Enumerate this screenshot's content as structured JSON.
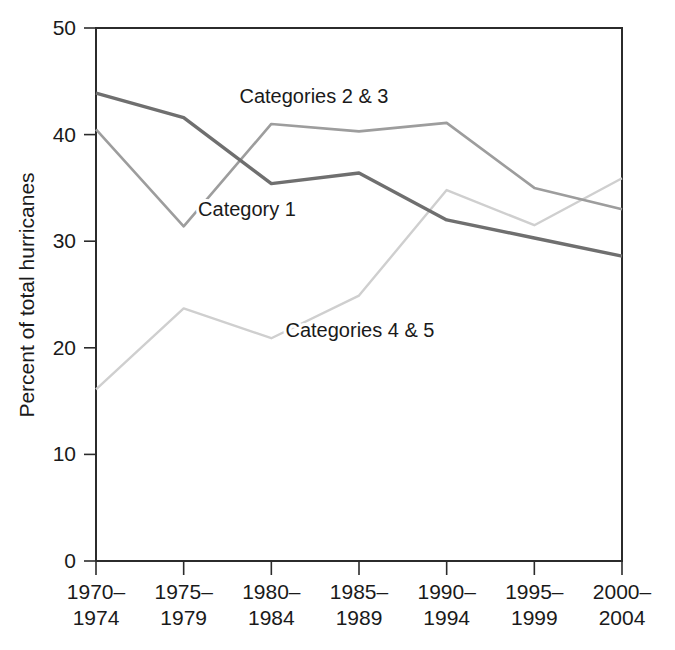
{
  "chart_data": {
    "type": "line",
    "title": "",
    "xlabel": "",
    "ylabel": "Percent of total hurricanes",
    "categories": [
      "1970–1974",
      "1975–1979",
      "1980–1984",
      "1985–1989",
      "1990–1994",
      "1995–1999",
      "2000–2004"
    ],
    "category_lines": [
      [
        "1970–",
        "1974"
      ],
      [
        "1975–",
        "1979"
      ],
      [
        "1980–",
        "1984"
      ],
      [
        "1985–",
        "1989"
      ],
      [
        "1990–",
        "1994"
      ],
      [
        "1995–",
        "1999"
      ],
      [
        "2000–",
        "2004"
      ]
    ],
    "series": [
      {
        "name": "Category 1",
        "color": "#6f6f6f",
        "values": [
          43.9,
          41.6,
          35.4,
          36.4,
          32.0,
          30.3,
          28.6
        ]
      },
      {
        "name": "Categories 2 & 3",
        "color": "#9d9d9d",
        "values": [
          40.5,
          31.4,
          41.0,
          40.3,
          41.1,
          35.0,
          33.0
        ]
      },
      {
        "name": "Categories 4 & 5",
        "color": "#cfcfcf",
        "values": [
          16.1,
          23.7,
          20.9,
          24.9,
          34.8,
          31.5,
          35.9
        ]
      }
    ],
    "ylim": [
      0,
      50
    ],
    "yticks": [
      0,
      10,
      20,
      30,
      40,
      50
    ],
    "ytick_labels": [
      "0",
      "10",
      "20",
      "30",
      "40",
      "50"
    ],
    "grid": false,
    "legend_position": "inline-annotations",
    "annotations": [
      {
        "text": "Categories 2 & 3",
        "series": "Categories 2 & 3",
        "x": 314,
        "y": 103
      },
      {
        "text": "Category 1",
        "series": "Category 1",
        "x": 247,
        "y": 216
      },
      {
        "text": "Categories 4 & 5",
        "series": "Categories 4 & 5",
        "x": 360,
        "y": 337
      }
    ]
  },
  "axes": {
    "frame_color": "#2b2b2b",
    "background": "#ffffff"
  }
}
